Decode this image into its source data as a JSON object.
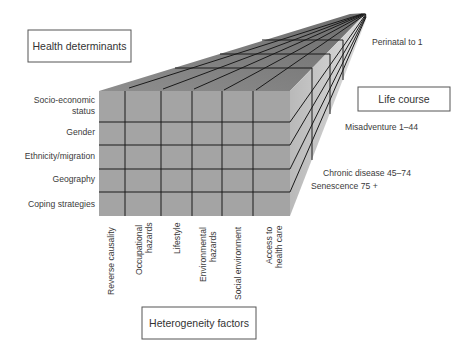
{
  "diagram": {
    "title_boxes": {
      "health_determinants": "Health determinants",
      "life_course": "Life course",
      "heterogeneity_factors": "Heterogeneity factors"
    },
    "health_determinants": [
      "Socio-economic",
      "status",
      "Gender",
      "Ethnicity/migration",
      "Geography",
      "Coping strategies"
    ],
    "life_course": [
      "Perinatal to 1",
      "Misadventure 1–44",
      "Chronic disease 45–74",
      "Senescence 75 +"
    ],
    "heterogeneity_factors": [
      "Reverse causality",
      "Occupational",
      "hazards",
      "Lifestyle",
      "Environmental",
      "hazards",
      "Social environment",
      "Access to",
      "health care"
    ],
    "colors": {
      "front_face": "#a4a4a4",
      "top_face": "#8a8a8a",
      "side_face": "#c4c4c4",
      "grid_lines": "#1a1a1a",
      "box_border": "#555555"
    }
  }
}
